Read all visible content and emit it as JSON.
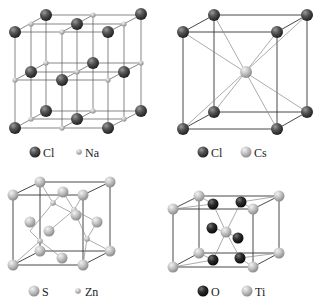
{
  "figure": {
    "panels": [
      {
        "id": "nacl",
        "title": "NaCl rock-salt structure",
        "legend": [
          {
            "symbol": "Cl",
            "style": "large-dark"
          },
          {
            "symbol": "Na",
            "style": "small-light"
          }
        ]
      },
      {
        "id": "cscl",
        "title": "CsCl structure",
        "legend": [
          {
            "symbol": "Cl",
            "style": "large-dark"
          },
          {
            "symbol": "Cs",
            "style": "large-light"
          }
        ]
      },
      {
        "id": "zns",
        "title": "ZnS zinc blende structure",
        "legend": [
          {
            "symbol": "S",
            "style": "large-light"
          },
          {
            "symbol": "Zn",
            "style": "small-light"
          }
        ]
      },
      {
        "id": "tio2",
        "title": "TiO2 rutile structure",
        "legend": [
          {
            "symbol": "O",
            "style": "large-black"
          },
          {
            "symbol": "Ti",
            "style": "large-light"
          }
        ]
      }
    ],
    "colors": {
      "dark_sphere": "#4a4a4a",
      "light_sphere": "#bdbdbd",
      "black_sphere": "#222222",
      "edge": "#333333"
    }
  }
}
